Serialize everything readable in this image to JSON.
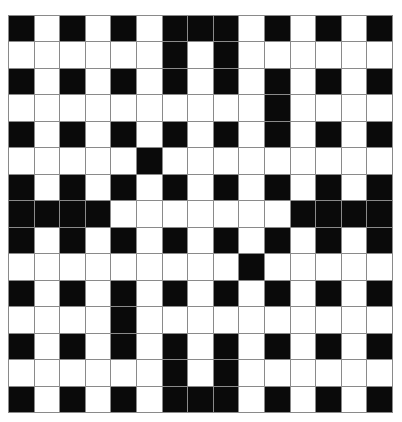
{
  "puzzle": {
    "type": "crossword",
    "rows": 15,
    "cols": 15,
    "colors": {
      "black": "#0a0a0a",
      "white": "#ffffff",
      "grid_line": "#8a8a8a"
    },
    "grid": [
      "#.#.#.###.#.#.#",
      "......#.#......",
      "#.#.#.#.#.#.#.#",
      "..........#....",
      "#.#.#.#.#.#.#.#",
      ".....#.........",
      "#.#.#.#.#.#.#.#",
      "####.......####",
      "#.#.#.#.#.#.#.#",
      ".........#.....",
      "#.#.#.#.#.#.#.#",
      "....#..........",
      "#.#.#.#.#.#.#.#",
      "......#.#......",
      "#.#.#.###.#.#.#"
    ]
  }
}
